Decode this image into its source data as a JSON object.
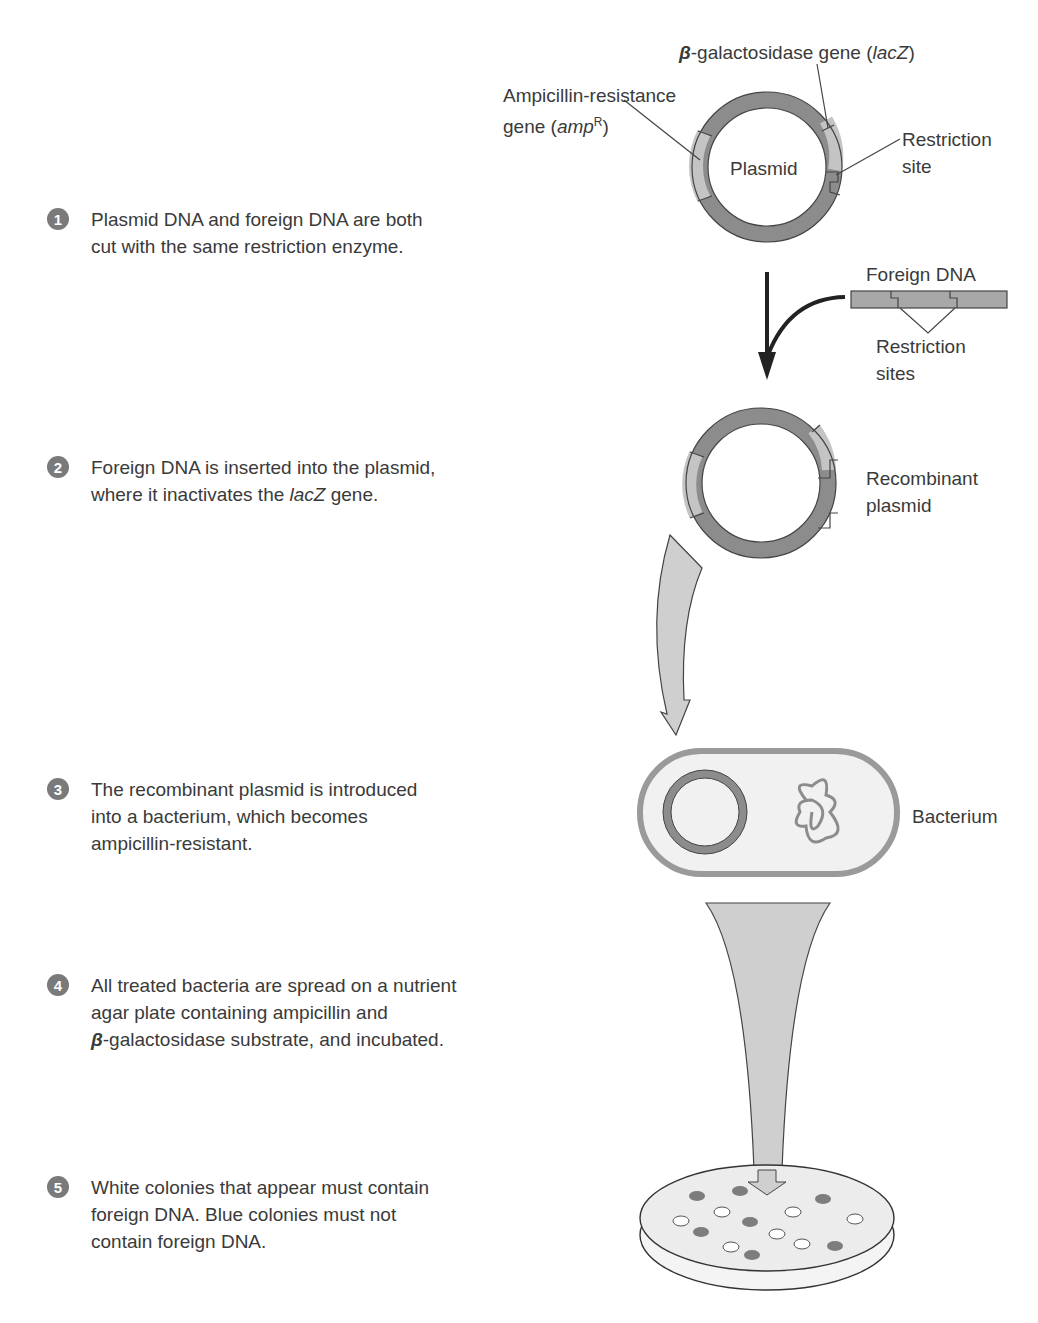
{
  "steps": [
    {
      "number": "1",
      "text": "Plasmid DNA and foreign DNA are both\ncut with the same restriction enzyme."
    },
    {
      "number": "2",
      "text_before": "Foreign DNA is inserted into the plasmid,\nwhere it inactivates the ",
      "text_italic": "lacZ",
      "text_after": " gene."
    },
    {
      "number": "3",
      "text": "The recombinant plasmid is introduced\ninto a bacterium, which becomes\nampicillin-resistant."
    },
    {
      "number": "4",
      "text_before": "All treated bacteria are spread on a nutrient\nagar plate containing ampicillin and\n",
      "text_greek": "β",
      "text_after": "-galactosidase substrate, and incubated."
    },
    {
      "number": "5",
      "text": "White colonies that appear must contain\nforeign DNA. Blue colonies must not\ncontain foreign DNA."
    }
  ],
  "labels": {
    "lacz_prefix": "β",
    "lacz_main": "-galactosidase gene (",
    "lacz_italic": "lacZ",
    "lacz_suffix": ")",
    "ampr_line1": "Ampicillin-resistance",
    "ampr_line2_prefix": "gene (",
    "ampr_italic": "amp",
    "ampr_sup": "R",
    "ampr_suffix": ")",
    "plasmid": "Plasmid",
    "restriction_site": "Restriction\nsite",
    "foreign_dna": "Foreign DNA",
    "restriction_sites": "Restriction\nsites",
    "recombinant_plasmid": "Recombinant\nplasmid",
    "bacterium": "Bacterium"
  },
  "colors": {
    "ring_dark": "#8c8c8c",
    "ring_light": "#c4c4c4",
    "arrow_fill": "#cfcfcf",
    "number_badge": "#7a7a7a",
    "colony_blue": "#7d7d7d",
    "colony_white": "#ffffff",
    "text": "#3a3a3a"
  },
  "petri_dish": {
    "blue_colonies": 7,
    "white_colonies": 8
  }
}
